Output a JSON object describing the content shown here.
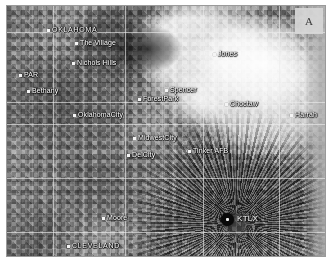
{
  "figure": {
    "panel_letter": "A",
    "type": "weather-radar-reflectivity-grayscale"
  },
  "radar_site": {
    "id": "KTLX",
    "marker": "radar-site-dot"
  },
  "counties": [
    {
      "name": "OKLAHOMA",
      "x": 40,
      "y": 20
    },
    {
      "name": "CLEVELAND",
      "x": 60,
      "y": 236
    }
  ],
  "cities": [
    {
      "name": "The Village",
      "x": 68,
      "y": 33
    },
    {
      "name": "Nichols Hills",
      "x": 65,
      "y": 53
    },
    {
      "name": "PAR",
      "x": 12,
      "y": 65
    },
    {
      "name": "Bethany",
      "x": 20,
      "y": 81
    },
    {
      "name": "Spencer",
      "x": 158,
      "y": 80
    },
    {
      "name": "ForestPark",
      "x": 131,
      "y": 89
    },
    {
      "name": "Jones",
      "x": 206,
      "y": 44
    },
    {
      "name": "OklahomaCity",
      "x": 66,
      "y": 105
    },
    {
      "name": "Choctaw",
      "x": 218,
      "y": 94
    },
    {
      "name": "Harrah",
      "x": 283,
      "y": 105
    },
    {
      "name": "MidwestCity",
      "x": 126,
      "y": 128
    },
    {
      "name": "DelCity",
      "x": 120,
      "y": 145
    },
    {
      "name": "Tinker AFB",
      "x": 181,
      "y": 141
    },
    {
      "name": "Moore",
      "x": 95,
      "y": 208
    }
  ],
  "overlay": {
    "grid_lines_visible": true,
    "county_boundaries_visible": true
  },
  "colors": {
    "background": "#ffffff",
    "panel_border": "#9a9a9a",
    "label_text": "#ffffff",
    "label_halo": "#000000",
    "radar_marker": "#0a0a0a",
    "panel_letter_bg": "#d7d7d7",
    "panel_letter_text": "#3a3a3a"
  }
}
